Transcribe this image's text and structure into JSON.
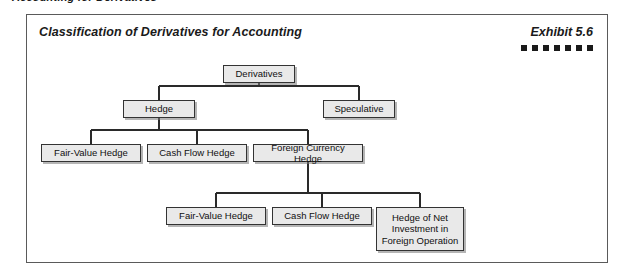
{
  "page": {
    "header": "Accounting for Derivatives"
  },
  "exhibit": {
    "title": "Classification of Derivatives for Accounting",
    "number": "Exhibit 5.6",
    "dot_count": 7
  },
  "diagram": {
    "type": "tree",
    "nodes": [
      {
        "id": "derivatives",
        "label": "Derivatives",
        "level": 0,
        "x": 196,
        "y": 50,
        "w": 72,
        "h": 18
      },
      {
        "id": "hedge",
        "label": "Hedge",
        "level": 1,
        "x": 96,
        "y": 85,
        "w": 72,
        "h": 18
      },
      {
        "id": "speculative",
        "label": "Speculative",
        "level": 1,
        "x": 296,
        "y": 85,
        "w": 72,
        "h": 18
      },
      {
        "id": "fair-value-hedge",
        "label": "Fair-Value Hedge",
        "level": 2,
        "x": 14,
        "y": 129,
        "w": 100,
        "h": 18
      },
      {
        "id": "cash-flow-hedge",
        "label": "Cash Flow Hedge",
        "level": 2,
        "x": 120,
        "y": 129,
        "w": 100,
        "h": 18
      },
      {
        "id": "foreign-currency-hedge",
        "label": "Foreign Currency Hedge",
        "level": 2,
        "x": 226,
        "y": 129,
        "w": 110,
        "h": 18
      },
      {
        "id": "fv-hedge-2",
        "label": "Fair-Value Hedge",
        "level": 3,
        "x": 139,
        "y": 192,
        "w": 100,
        "h": 18
      },
      {
        "id": "cf-hedge-2",
        "label": "Cash Flow Hedge",
        "level": 3,
        "x": 245,
        "y": 192,
        "w": 100,
        "h": 18
      },
      {
        "id": "hedge-net-investment",
        "label": "Hedge of Net Investment in Foreign Operation",
        "level": 3,
        "x": 349,
        "y": 192,
        "w": 88,
        "h": 44
      }
    ],
    "edges": [
      {
        "from": "derivatives",
        "to": [
          "hedge",
          "speculative"
        ]
      },
      {
        "from": "hedge",
        "to": [
          "fair-value-hedge",
          "cash-flow-hedge",
          "foreign-currency-hedge"
        ]
      },
      {
        "from": "foreign-currency-hedge",
        "to": [
          "fv-hedge-2",
          "cf-hedge-2",
          "hedge-net-investment"
        ]
      }
    ]
  }
}
